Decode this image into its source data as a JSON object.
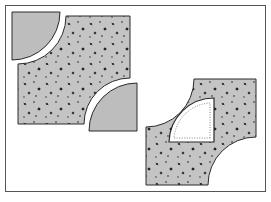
{
  "figure": {
    "colors": {
      "background": "#ffffff",
      "frame": "#555555",
      "fabric_solid": "#bdbdbd",
      "fabric_print": "#c4c4c4",
      "print_dots": "#1e1e1e",
      "outline": "#2a2a2a",
      "template": "#ffffff",
      "seam_line": "#666666"
    },
    "pieces": [
      {
        "name": "solid-quarter-circle-top-left",
        "type": "quarter-circle",
        "fill": "solid"
      },
      {
        "name": "printed-square-concave-corners",
        "type": "square-with-two-concave-cuts",
        "fill": "print"
      },
      {
        "name": "solid-quarter-circle-bottom-right",
        "type": "quarter-circle",
        "fill": "solid"
      },
      {
        "name": "printed-square-with-template",
        "type": "square-with-two-concave-cuts",
        "fill": "print"
      },
      {
        "name": "paper-template-quarter-circle",
        "type": "quarter-circle",
        "fill": "white",
        "seam_allowance": "dotted"
      }
    ]
  }
}
